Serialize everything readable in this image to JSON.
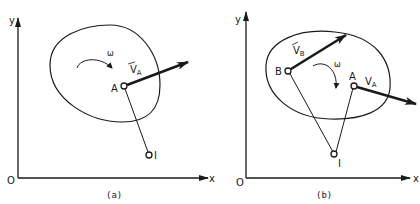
{
  "figure": {
    "panels": [
      {
        "id": "a",
        "caption": "(a)",
        "axes": {
          "x_label": "x",
          "y_label": "y",
          "origin_label": "O"
        },
        "points": {
          "A": "A",
          "I": "I"
        },
        "velocity_labels": {
          "vA_main": "V",
          "vA_sub": "A"
        },
        "angular_velocity": "ω"
      },
      {
        "id": "b",
        "caption": "(b)",
        "axes": {
          "x_label": "x",
          "y_label": "y",
          "origin_label": "O"
        },
        "points": {
          "A": "A",
          "B": "B",
          "I": "I"
        },
        "velocity_labels": {
          "vB_main": "V",
          "vB_sub": "B",
          "vA_main": "V",
          "vA_sub": "A"
        },
        "angular_velocity": "ω"
      }
    ],
    "colors": {
      "ink": "#1a1a1a",
      "background": "#ffffff"
    }
  }
}
